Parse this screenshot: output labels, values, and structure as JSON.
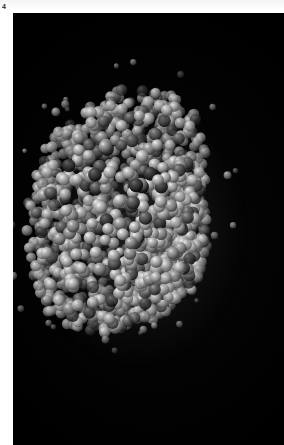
{
  "plate": {
    "figure_number": "4",
    "background_color": "#ffffff"
  },
  "panel": {
    "background_color": "#000000",
    "left": 13,
    "top": 13,
    "width": 271,
    "height": 432
  },
  "subject": {
    "kind": "space-filling molecular model",
    "description": "Dense roughly spherical cluster of atoms rendered as shaded spheres on a black background",
    "render_style": "CPK space-filling / van der Waals surface",
    "atom_light_color": "#b9b9b9",
    "atom_mid_color": "#8d8d8d",
    "atom_dark_color": "#4a4a4a",
    "highlight_color": "#f0f0f0",
    "shadow_color": "#111111",
    "center_x": 124,
    "center_y": 217,
    "radius_x": 100,
    "radius_y": 129,
    "atom_count": 1400,
    "atom_radius_min": 3.2,
    "atom_radius_max": 6.4
  }
}
